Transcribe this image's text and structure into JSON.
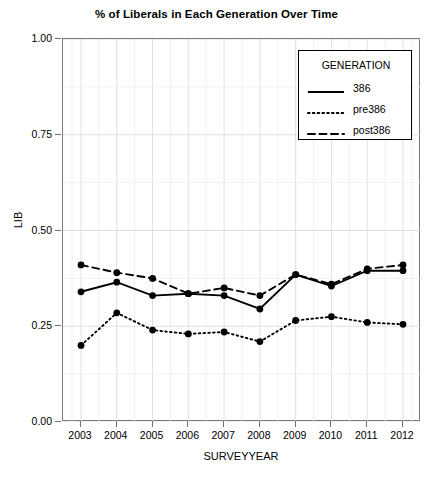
{
  "chart_data": {
    "type": "line",
    "title": "% of Liberals in Each Generation Over Time",
    "xlabel": "SURVEYYEAR",
    "ylabel": "LIB",
    "categories": [
      "2003",
      "2004",
      "2005",
      "2006",
      "2007",
      "2008",
      "2009",
      "2010",
      "2011",
      "2012"
    ],
    "x": [
      2003,
      2004,
      2005,
      2006,
      2007,
      2008,
      2009,
      2010,
      2011,
      2012
    ],
    "ylim": [
      0.0,
      1.0
    ],
    "yticks": [
      "0.00",
      "0.25",
      "0.50",
      "0.75",
      "1.00"
    ],
    "ytick_values": [
      0.0,
      0.25,
      0.5,
      0.75,
      1.0
    ],
    "grid": true,
    "legend_position": "top-right",
    "legend_title": "GENERATION",
    "markers": "filled-circle",
    "series": [
      {
        "name": "386",
        "style": "solid",
        "color": "#000000",
        "values": [
          0.34,
          0.365,
          0.33,
          0.335,
          0.33,
          0.295,
          0.385,
          0.355,
          0.395,
          0.395
        ]
      },
      {
        "name": "pre386",
        "style": "dotted",
        "color": "#000000",
        "values": [
          0.2,
          0.285,
          0.24,
          0.23,
          0.235,
          0.21,
          0.265,
          0.275,
          0.26,
          0.255
        ]
      },
      {
        "name": "post386",
        "style": "dashed",
        "color": "#000000",
        "values": [
          0.41,
          0.39,
          0.375,
          0.335,
          0.35,
          0.33,
          0.385,
          0.36,
          0.4,
          0.41
        ]
      }
    ]
  }
}
